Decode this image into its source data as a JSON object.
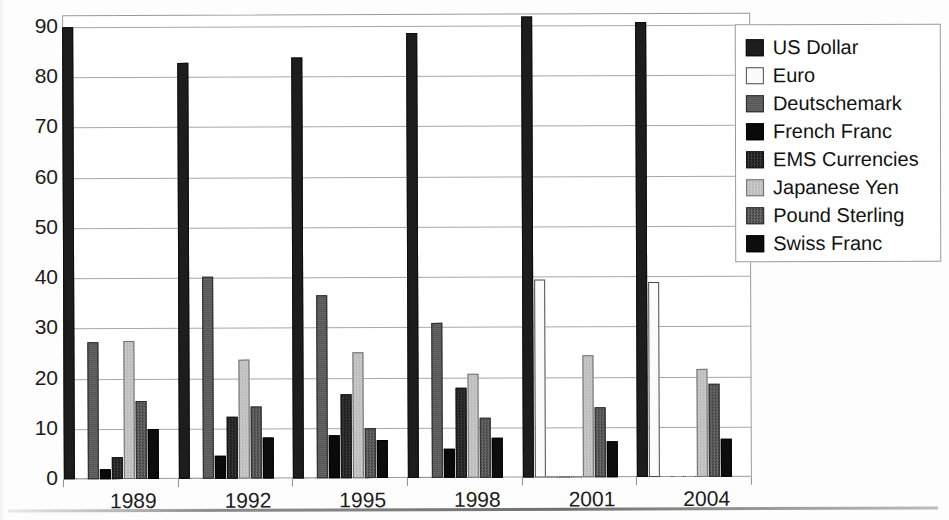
{
  "chart_data": {
    "type": "bar",
    "title": "",
    "xlabel": "",
    "ylabel": "",
    "categories": [
      "1989",
      "1992",
      "1995",
      "1998",
      "2001",
      "2004"
    ],
    "ylim": [
      0,
      90
    ],
    "yticks": [
      "0",
      "10",
      "20",
      "30",
      "40",
      "50",
      "60",
      "70",
      "80",
      "90"
    ],
    "grid": true,
    "legend_position": "top-right",
    "series": [
      {
        "name": "US Dollar",
        "key": "usd",
        "swatch": "dark-solid",
        "values": [
          90.0,
          82.8,
          83.9,
          88.6,
          91.8,
          90.7
        ]
      },
      {
        "name": "Euro",
        "key": "eur",
        "swatch": "white-outline",
        "values": [
          0.0,
          0.0,
          0.0,
          0.0,
          39.4,
          38.8
        ]
      },
      {
        "name": "Deutschemark",
        "key": "dem",
        "swatch": "medium-gray",
        "values": [
          27.3,
          40.3,
          36.5,
          30.8,
          0.0,
          0.0
        ]
      },
      {
        "name": "French Franc",
        "key": "frf",
        "swatch": "near-black",
        "values": [
          1.9,
          4.5,
          8.5,
          5.7,
          0.0,
          0.0
        ]
      },
      {
        "name": "EMS Currencies",
        "key": "ems",
        "swatch": "dark-dither",
        "values": [
          4.3,
          12.3,
          16.8,
          17.9,
          0.0,
          0.0
        ]
      },
      {
        "name": "Japanese Yen",
        "key": "jpy",
        "swatch": "light-gray-dither",
        "values": [
          27.5,
          23.7,
          25.0,
          20.8,
          24.3,
          21.5
        ]
      },
      {
        "name": "Pound Sterling",
        "key": "gbp",
        "swatch": "mid-dark-dither",
        "values": [
          15.5,
          14.4,
          10.0,
          11.9,
          14.0,
          18.5
        ]
      },
      {
        "name": "Swiss Franc",
        "key": "chf",
        "swatch": "black-solid",
        "values": [
          10.0,
          8.1,
          7.6,
          7.9,
          7.2,
          7.5
        ]
      }
    ]
  },
  "legend": {
    "items": [
      {
        "label": "US Dollar"
      },
      {
        "label": "Euro"
      },
      {
        "label": "Deutschemark"
      },
      {
        "label": "French Franc"
      },
      {
        "label": "EMS Currencies"
      },
      {
        "label": "Japanese Yen"
      },
      {
        "label": "Pound Sterling"
      },
      {
        "label": "Swiss Franc"
      }
    ]
  },
  "colors": {
    "axis": "#1b1b1b",
    "grid": "#a8a8a8",
    "frame": "#9a9a9a",
    "background": "#ffffff"
  }
}
